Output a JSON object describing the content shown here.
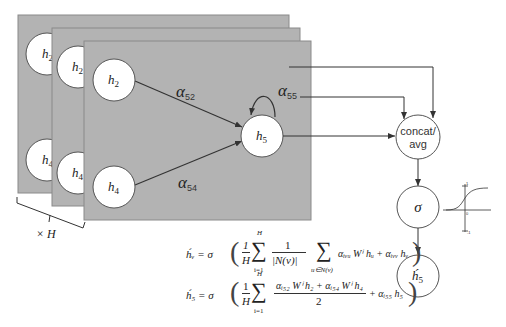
{
  "diagram": {
    "heads_label": "× H",
    "back_panels": [
      {
        "node_top": "h",
        "node_top_sub": "2",
        "node_bottom": "h",
        "node_bottom_sub": "4"
      },
      {
        "node_top": "h",
        "node_top_sub": "2",
        "node_bottom": "h",
        "node_bottom_sub": "4"
      }
    ],
    "front_panel": {
      "nodes": {
        "h2": {
          "label": "h",
          "sub": "2"
        },
        "h4": {
          "label": "h",
          "sub": "4"
        },
        "h5": {
          "label": "h",
          "sub": "5"
        }
      },
      "edges": {
        "a52": {
          "label": "α",
          "sub": "52"
        },
        "a54": {
          "label": "α",
          "sub": "54"
        },
        "a55": {
          "label": "α",
          "sub": "55"
        }
      }
    },
    "aggregate_node": {
      "line1": "concat/",
      "line2": "avg"
    },
    "activation_node": {
      "label": "σ"
    },
    "output_node": {
      "label": "h́",
      "sub": "5"
    },
    "sigmoid_plot": {
      "top_tick": "1",
      "origin": "0",
      "bottom_tick": "-1"
    },
    "colors": {
      "panel": "#b3b3b3",
      "panel_border": "#8a8a8a",
      "node_fill": "#ffffff",
      "line": "#333333"
    }
  },
  "equations": {
    "eq1": {
      "lhs": "h́ᵥ = σ",
      "frac_num": "1",
      "frac_den": "H",
      "sum1_top": "H",
      "sum1_bot": "i=1",
      "frac2_num": "1",
      "frac2_den": "|N(v)|",
      "sum2_bot": "u∈N(v)",
      "term1": "αᵢᵥᵤ Wⁱ hᵤ  +  αᵢᵥᵥ hᵥ"
    },
    "eq2": {
      "lhs": "h́₅ = σ",
      "frac_num": "1",
      "frac_den": "H",
      "sum_top": "H",
      "sum_bot": "i=1",
      "frac2_num": "αᵢ₅₂ Wⁱ h₂ + αᵢ₅₄ Wⁱ h₄",
      "frac2_den": "2",
      "term": "+ αᵢ₅₅ h₅"
    }
  }
}
